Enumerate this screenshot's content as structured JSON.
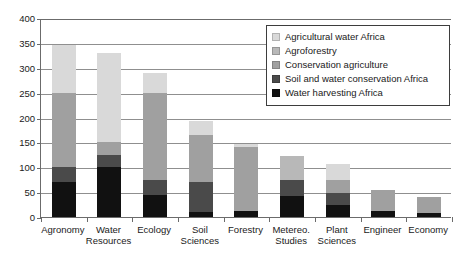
{
  "chart_data": {
    "type": "bar",
    "stacked": true,
    "title": "",
    "xlabel": "",
    "ylabel": "",
    "ylim": [
      0,
      400
    ],
    "yticks": [
      0,
      50,
      100,
      150,
      200,
      250,
      300,
      350,
      400
    ],
    "grid": true,
    "legend_position": "top-right",
    "categories": [
      "Agronomy",
      "Water\nResources",
      "Ecology",
      "Soil\nSciences",
      "Forestry",
      "Metereo.\nStudies",
      "Plant\nSciences",
      "Engineer",
      "Economy"
    ],
    "series": [
      {
        "name": "Water harvesting Africa",
        "color": "#111111",
        "values": [
          70,
          100,
          45,
          10,
          12,
          42,
          25,
          13,
          8
        ]
      },
      {
        "name": "Soil and water conservation Africa",
        "color": "#4a4a4a",
        "values": [
          30,
          25,
          30,
          60,
          0,
          33,
          23,
          0,
          0
        ]
      },
      {
        "name": "Conservation agriculture",
        "color": "#a0a0a0",
        "values": [
          150,
          25,
          175,
          95,
          128,
          0,
          27,
          42,
          32
        ]
      },
      {
        "name": "Agroforestry",
        "color": "#b8b8b8",
        "values": [
          0,
          0,
          0,
          0,
          0,
          47,
          0,
          0,
          0
        ]
      },
      {
        "name": "Agricultural water Africa",
        "color": "#d9d9d9",
        "values": [
          96,
          180,
          40,
          28,
          7,
          0,
          32,
          0,
          0
        ]
      }
    ],
    "totals": [
      346,
      330,
      290,
      193,
      147,
      122,
      107,
      55,
      40
    ]
  },
  "legend": {
    "entries": [
      {
        "label": "Agricultural water Africa",
        "color": "#d9d9d9"
      },
      {
        "label": "Agroforestry",
        "color": "#b8b8b8"
      },
      {
        "label": "Conservation agriculture",
        "color": "#a0a0a0"
      },
      {
        "label": "Soil and water conservation Africa",
        "color": "#4a4a4a"
      },
      {
        "label": "Water harvesting Africa",
        "color": "#111111"
      }
    ]
  }
}
